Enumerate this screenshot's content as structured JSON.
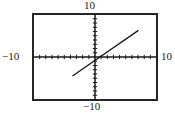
{
  "figure": {
    "kind": "graphing-calculator-viewing-window",
    "frame_color": "#262626",
    "axis_color": "#1a1a1a",
    "curve_color": "#1a1a1a",
    "background_color": "#ffffff"
  },
  "labels": {
    "top": "10",
    "left": "−10",
    "right": "10",
    "bottom": "−10"
  },
  "chart_data": {
    "type": "line",
    "title": "",
    "xlabel": "",
    "ylabel": "",
    "xlim": [
      -10,
      10
    ],
    "ylim": [
      -10,
      10
    ],
    "xtick_labels": [
      "−10",
      "10"
    ],
    "ytick_labels": [
      "−10",
      "10"
    ],
    "xtick_step": 1,
    "ytick_step": 1,
    "grid": false,
    "legend": null,
    "axes_drawn": true,
    "tick_marks_drawn": true,
    "series": [
      {
        "name": "line",
        "slope": 1,
        "intercept": -0.8,
        "x": [
          -3.6,
          7.0
        ],
        "y": [
          -4.4,
          6.2
        ]
      }
    ]
  }
}
